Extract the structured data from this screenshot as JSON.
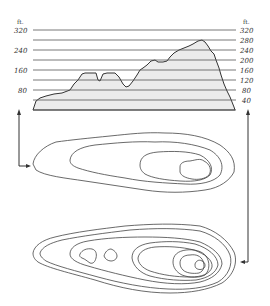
{
  "figure": {
    "type": "topographic-profile-and-contour-maps",
    "profile": {
      "unit_left": "ft.",
      "unit_right": "ft.",
      "left_axis_labels": [
        "320",
        "240",
        "160",
        "80"
      ],
      "right_axis_labels": [
        "320",
        "280",
        "240",
        "200",
        "160",
        "120",
        "80",
        "40"
      ],
      "contour_interval_ft": 40,
      "elevation_range_ft": [
        0,
        320
      ]
    },
    "upper_map": {
      "description": "Contour map with 4 contour lines, summit area at right end",
      "contour_count": 4
    },
    "lower_map": {
      "description": "Contour map with 8 contour lines, two small closed contours on left, summit on right",
      "contour_count": 8
    },
    "arrows": [
      {
        "name": "left-arrow",
        "description": "Connects upper contour map (left end) to profile baseline"
      },
      {
        "name": "right-arrow",
        "description": "Connects lower contour map (right end) to profile baseline"
      }
    ]
  }
}
